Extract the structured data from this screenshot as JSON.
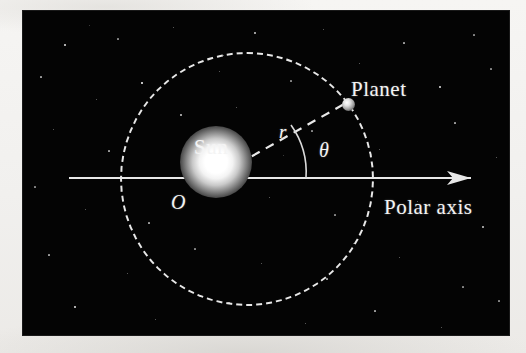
{
  "figure": {
    "kind": "astronomy-polar-coordinate-diagram",
    "caption_labels": {
      "sun": "Sun",
      "planet": "Planet",
      "polar_axis": "Polar axis",
      "origin": "O",
      "radius": "r",
      "angle": "θ"
    },
    "colors": {
      "sky_background": "#040404",
      "page_margin": "#f2f1ef",
      "line_white": "#e8e8e8",
      "star_white": "#ffffff",
      "sun_core": "#ffffff",
      "planet_body": "#d9d9d9"
    }
  },
  "chart_data": {
    "type": "scatter",
    "title": "",
    "xlabel": "Polar axis",
    "ylabel": "",
    "annotations": [
      {
        "name": "Sun",
        "role": "focus-at-origin",
        "x": 0,
        "y": 0
      },
      {
        "name": "O",
        "role": "origin-label",
        "x": 0,
        "y": 0
      },
      {
        "name": "Planet",
        "role": "orbiting-body",
        "r": 1.0,
        "theta_deg": 33
      },
      {
        "name": "r",
        "role": "radius-vector-label"
      },
      {
        "name": "θ",
        "role": "polar-angle-label"
      },
      {
        "name": "Polar axis",
        "role": "axis-label"
      }
    ],
    "series": [
      {
        "name": "orbit",
        "style": "dashed-circle",
        "center": [
          0,
          0
        ],
        "radius": 1.0
      },
      {
        "name": "radius-vector",
        "style": "dashed-line",
        "from": [
          0,
          0
        ],
        "to_polar": {
          "r": 1.0,
          "theta_deg": 33
        }
      },
      {
        "name": "polar-axis",
        "style": "solid-arrow",
        "from": [
          -0.82,
          0
        ],
        "to": [
          1.38,
          0
        ]
      },
      {
        "name": "angle-arc",
        "style": "thin-arc",
        "from_deg": 0,
        "to_deg": 33,
        "arc_radius": 0.47
      }
    ],
    "grid": false,
    "legend": null
  },
  "stars": [
    {
      "x": 42,
      "y": 34,
      "s": 1.4
    },
    {
      "x": 95,
      "y": 28,
      "s": 1.1
    },
    {
      "x": 150,
      "y": 16,
      "s": 1.0
    },
    {
      "x": 232,
      "y": 22,
      "s": 1.3
    },
    {
      "x": 300,
      "y": 18,
      "s": 1.0
    },
    {
      "x": 381,
      "y": 32,
      "s": 1.2
    },
    {
      "x": 451,
      "y": 24,
      "s": 1.1
    },
    {
      "x": 18,
      "y": 66,
      "s": 1.2
    },
    {
      "x": 73,
      "y": 88,
      "s": 1.0
    },
    {
      "x": 119,
      "y": 72,
      "s": 1.5
    },
    {
      "x": 196,
      "y": 60,
      "s": 1.0
    },
    {
      "x": 268,
      "y": 70,
      "s": 1.1
    },
    {
      "x": 336,
      "y": 52,
      "s": 1.0
    },
    {
      "x": 417,
      "y": 76,
      "s": 1.4
    },
    {
      "x": 468,
      "y": 58,
      "s": 1.1
    },
    {
      "x": 30,
      "y": 118,
      "s": 1.0
    },
    {
      "x": 86,
      "y": 140,
      "s": 1.2
    },
    {
      "x": 158,
      "y": 104,
      "s": 1.3
    },
    {
      "x": 213,
      "y": 96,
      "s": 1.0
    },
    {
      "x": 289,
      "y": 120,
      "s": 1.1
    },
    {
      "x": 356,
      "y": 138,
      "s": 1.0
    },
    {
      "x": 432,
      "y": 112,
      "s": 1.2
    },
    {
      "x": 473,
      "y": 146,
      "s": 1.0
    },
    {
      "x": 12,
      "y": 176,
      "s": 1.1
    },
    {
      "x": 62,
      "y": 198,
      "s": 1.0
    },
    {
      "x": 126,
      "y": 212,
      "s": 1.2
    },
    {
      "x": 246,
      "y": 186,
      "s": 1.0
    },
    {
      "x": 312,
      "y": 204,
      "s": 1.1
    },
    {
      "x": 394,
      "y": 190,
      "s": 1.0
    },
    {
      "x": 460,
      "y": 216,
      "s": 1.3
    },
    {
      "x": 26,
      "y": 244,
      "s": 1.2
    },
    {
      "x": 104,
      "y": 262,
      "s": 1.0
    },
    {
      "x": 172,
      "y": 238,
      "s": 1.1
    },
    {
      "x": 238,
      "y": 252,
      "s": 1.0
    },
    {
      "x": 304,
      "y": 268,
      "s": 1.2
    },
    {
      "x": 376,
      "y": 246,
      "s": 1.0
    },
    {
      "x": 440,
      "y": 276,
      "s": 1.1
    },
    {
      "x": 52,
      "y": 296,
      "s": 1.4
    },
    {
      "x": 132,
      "y": 308,
      "s": 1.0
    },
    {
      "x": 206,
      "y": 292,
      "s": 1.1
    },
    {
      "x": 282,
      "y": 312,
      "s": 1.0
    },
    {
      "x": 352,
      "y": 300,
      "s": 1.2
    },
    {
      "x": 418,
      "y": 316,
      "s": 1.0
    },
    {
      "x": 476,
      "y": 290,
      "s": 1.1
    },
    {
      "x": 200,
      "y": 44,
      "s": 1.0
    },
    {
      "x": 144,
      "y": 166,
      "s": 1.0
    },
    {
      "x": 330,
      "y": 232,
      "s": 1.0
    },
    {
      "x": 260,
      "y": 144,
      "s": 0.9
    },
    {
      "x": 66,
      "y": 14,
      "s": 0.9
    }
  ]
}
